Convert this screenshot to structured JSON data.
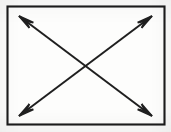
{
  "figure": {
    "kind": "geometric-diagram",
    "background_color": "#fbfbfa",
    "ink_color": "#1f1f1f",
    "canvas": {
      "width": 171,
      "height": 132
    },
    "shapes": {
      "rectangle": {
        "name": "outer-rectangle",
        "x": 7.5,
        "y": 6.5,
        "width": 157,
        "height": 118,
        "stroke_width": 2.1,
        "fill": "#fdfdfc"
      },
      "arrows": [
        {
          "name": "diagonal-arrow-tlbr",
          "label": "top-left to bottom-right diagonal",
          "double_headed": true,
          "x1": 19,
          "y1": 16,
          "x2": 152,
          "y2": 116
        },
        {
          "name": "diagonal-arrow-trbl",
          "label": "top-right to bottom-left diagonal",
          "double_headed": true,
          "x1": 152,
          "y1": 16,
          "x2": 19,
          "y2": 116
        }
      ],
      "arrowheads": [
        {
          "name": "arrowhead-top-left",
          "direction": "up-left",
          "tip_x": 19,
          "tip_y": 16
        },
        {
          "name": "arrowhead-top-right",
          "direction": "up-right",
          "tip_x": 152,
          "tip_y": 16
        },
        {
          "name": "arrowhead-bottom-left",
          "direction": "down-left",
          "tip_x": 19,
          "tip_y": 116
        },
        {
          "name": "arrowhead-bottom-right",
          "direction": "down-right",
          "tip_x": 152,
          "tip_y": 116
        }
      ],
      "intersection": {
        "name": "center-crossing",
        "x": 85.5,
        "y": 66
      }
    }
  }
}
